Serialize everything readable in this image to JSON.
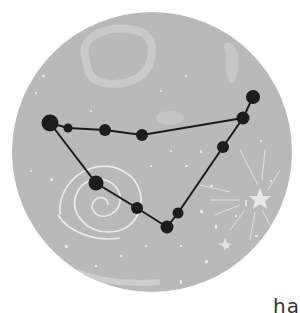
{
  "illustration": {
    "subject": "Capricorn constellation",
    "background_color": "#b9b9b9",
    "line_color": "#1a1a1a",
    "star_color": "#1c1c1c",
    "decor_color": "#e6e6e6",
    "stars": [
      {
        "id": "s1",
        "name": "left-large-star"
      },
      {
        "id": "s2",
        "name": "left-small-star"
      },
      {
        "id": "s3",
        "name": "top-mid-star-1"
      },
      {
        "id": "s4",
        "name": "top-mid-star-2"
      },
      {
        "id": "s5",
        "name": "right-star"
      },
      {
        "id": "s6",
        "name": "right-top-star"
      },
      {
        "id": "s7",
        "name": "right-lower-star"
      },
      {
        "id": "s8",
        "name": "spiral-star"
      },
      {
        "id": "s9",
        "name": "bottom-mid-star"
      },
      {
        "id": "s10",
        "name": "bottom-right-star"
      },
      {
        "id": "s11",
        "name": "bottom-star"
      }
    ]
  },
  "caption": {
    "text": "ha"
  }
}
